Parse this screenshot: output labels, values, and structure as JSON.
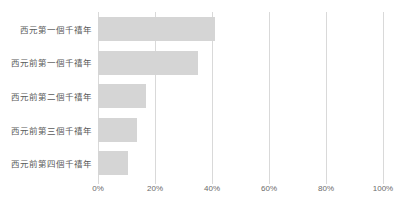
{
  "chart_data": {
    "type": "bar",
    "orientation": "horizontal",
    "title": "",
    "subtitle": "",
    "xlabel": "",
    "ylabel": "",
    "categories": [
      "西元第一個千禧年",
      "西元前第一個千禧年",
      "西元前第二個千禧年",
      "西元前第三個千禧年",
      "西元前第四個千禧年"
    ],
    "values": [
      41.0,
      35.0,
      17.0,
      13.7,
      10.5
    ],
    "value_unit": "%",
    "xlim": [
      0,
      100
    ],
    "xticks": [
      0,
      20,
      40,
      60,
      80,
      100
    ],
    "xtick_labels": [
      "0%",
      "20%",
      "40%",
      "60%",
      "80%",
      "100%"
    ],
    "grid": true,
    "grid_axis": "x",
    "legend": false,
    "legend_position": "none",
    "series": [
      {
        "name": "",
        "values": [
          41.0,
          35.0,
          17.0,
          13.7,
          10.5
        ]
      }
    ],
    "colors": {
      "bar": "#d5d5d5",
      "gridline": "#d9d9d9",
      "axis_text": "#6b6b6b",
      "category_text": "#5a5a5a",
      "background": "#ffffff"
    }
  }
}
